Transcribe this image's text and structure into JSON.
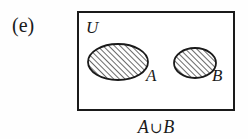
{
  "figure": {
    "part_label": "(e)",
    "universe_label": "U",
    "caption_left_operand": "A",
    "caption_operator": "∪",
    "caption_right_operand": "B",
    "caption_full": "A ∪ B",
    "stroke_color": "#1a1a1a",
    "fill_color": "#ffffff",
    "background_color": "#fefefe",
    "hatch_color": "#2b2b2b"
  },
  "universe": {
    "label": "U",
    "shape": "rectangle",
    "x": 78,
    "y": 12,
    "width": 156,
    "height": 98,
    "label_x": 86,
    "label_y": 18
  },
  "sets": [
    {
      "label": "A",
      "shape": "ellipse",
      "cx": 118,
      "cy": 62,
      "rx": 30,
      "ry": 18,
      "hatched": true,
      "hatch_direction": "forward-slash",
      "label_x": 146,
      "label_y": 68
    },
    {
      "label": "B",
      "shape": "ellipse",
      "cx": 195,
      "cy": 63,
      "rx": 21,
      "ry": 15,
      "hatched": true,
      "hatch_direction": "forward-slash",
      "label_x": 213,
      "label_y": 68
    }
  ]
}
